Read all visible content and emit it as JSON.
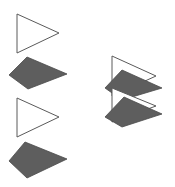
{
  "diagram": {
    "width": 175,
    "height": 187,
    "background": "#ffffff",
    "colors": {
      "outline_stroke": "#5a5a5a",
      "outline_fill": "#ffffff",
      "dark_fill": "#5e5e5e",
      "dark_stroke": "#4a4a4a"
    },
    "left_column": {
      "shapes": [
        {
          "kind": "outline-triangle",
          "points": "17,14 17,53 59,33"
        },
        {
          "kind": "dark-quad",
          "points": "27,57 9,75 28,89 67,74"
        },
        {
          "kind": "outline-triangle",
          "points": "17,98 17,137 59,117"
        },
        {
          "kind": "dark-quad",
          "points": "25,142 9,161 27,178 67,159"
        }
      ]
    },
    "right_stack": {
      "shapes": [
        {
          "kind": "outline-triangle",
          "points": "112,56 112,96 156,76"
        },
        {
          "kind": "dark-quad",
          "points": "122,70 105,88 122,100 162,88"
        },
        {
          "kind": "outline-triangle",
          "points": "112,88 112,122 156,106"
        },
        {
          "kind": "dark-quad",
          "points": "124,97 105,117 122,127 162,114"
        }
      ]
    }
  }
}
